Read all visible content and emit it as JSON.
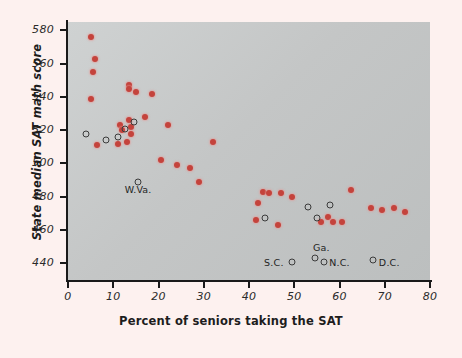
{
  "chart_data": {
    "type": "scatter",
    "title": "",
    "xlabel": "Percent of seniors taking the SAT",
    "ylabel": "State median SAT math score",
    "xlim": [
      0,
      80
    ],
    "ylim": [
      430,
      585
    ],
    "xticks": [
      0,
      10,
      20,
      30,
      40,
      50,
      60,
      70,
      80
    ],
    "yticks": [
      440,
      460,
      480,
      500,
      520,
      540,
      560,
      580
    ],
    "grid": false,
    "legend": null,
    "marker_colors": {
      "filled": "#c4433c",
      "open": "#3b3b3b"
    },
    "panel_background": "#c7caca",
    "figure_background": "#fdf1ef",
    "series": [
      {
        "name": "states-filled",
        "marker": "filled-circle",
        "points": [
          {
            "x": 5.0,
            "y": 576
          },
          {
            "x": 6.0,
            "y": 563
          },
          {
            "x": 5.5,
            "y": 555
          },
          {
            "x": 5.0,
            "y": 539
          },
          {
            "x": 13.5,
            "y": 547
          },
          {
            "x": 13.5,
            "y": 545
          },
          {
            "x": 15.0,
            "y": 543
          },
          {
            "x": 18.5,
            "y": 542
          },
          {
            "x": 6.5,
            "y": 511
          },
          {
            "x": 11.5,
            "y": 523
          },
          {
            "x": 12.0,
            "y": 520
          },
          {
            "x": 13.5,
            "y": 526
          },
          {
            "x": 14.0,
            "y": 522
          },
          {
            "x": 14.0,
            "y": 518
          },
          {
            "x": 13.0,
            "y": 513
          },
          {
            "x": 11.0,
            "y": 512
          },
          {
            "x": 17.0,
            "y": 528
          },
          {
            "x": 22.0,
            "y": 523
          },
          {
            "x": 20.5,
            "y": 502
          },
          {
            "x": 24.0,
            "y": 499
          },
          {
            "x": 27.0,
            "y": 497
          },
          {
            "x": 29.0,
            "y": 489
          },
          {
            "x": 32.0,
            "y": 513
          },
          {
            "x": 43.0,
            "y": 483
          },
          {
            "x": 44.5,
            "y": 482
          },
          {
            "x": 47.0,
            "y": 482
          },
          {
            "x": 49.5,
            "y": 480
          },
          {
            "x": 42.0,
            "y": 476
          },
          {
            "x": 41.5,
            "y": 466
          },
          {
            "x": 46.5,
            "y": 463
          },
          {
            "x": 57.5,
            "y": 468
          },
          {
            "x": 56.0,
            "y": 465
          },
          {
            "x": 58.5,
            "y": 465
          },
          {
            "x": 60.5,
            "y": 465
          },
          {
            "x": 62.5,
            "y": 484
          },
          {
            "x": 67.0,
            "y": 473
          },
          {
            "x": 69.5,
            "y": 472
          },
          {
            "x": 72.0,
            "y": 473
          },
          {
            "x": 74.5,
            "y": 471
          }
        ]
      },
      {
        "name": "states-open",
        "marker": "open-circle",
        "points": [
          {
            "x": 4.0,
            "y": 518
          },
          {
            "x": 8.5,
            "y": 514
          },
          {
            "x": 11.0,
            "y": 516
          },
          {
            "x": 12.5,
            "y": 521
          },
          {
            "x": 14.5,
            "y": 525
          },
          {
            "x": 15.5,
            "y": 489
          },
          {
            "x": 43.5,
            "y": 467
          },
          {
            "x": 53.0,
            "y": 474
          },
          {
            "x": 55.0,
            "y": 467
          },
          {
            "x": 58.0,
            "y": 475
          },
          {
            "x": 54.5,
            "y": 443
          },
          {
            "x": 49.5,
            "y": 441
          },
          {
            "x": 56.5,
            "y": 441
          },
          {
            "x": 67.5,
            "y": 442
          }
        ]
      }
    ],
    "annotations": [
      {
        "text": "W.Va.",
        "x": 15.5,
        "y": 484
      },
      {
        "text": "Ga.",
        "x": 56.0,
        "y": 449
      },
      {
        "text": "S.C.",
        "x": 45.5,
        "y": 440
      },
      {
        "text": "N.C.",
        "x": 60.0,
        "y": 440
      },
      {
        "text": "D.C.",
        "x": 71.0,
        "y": 440
      }
    ]
  }
}
